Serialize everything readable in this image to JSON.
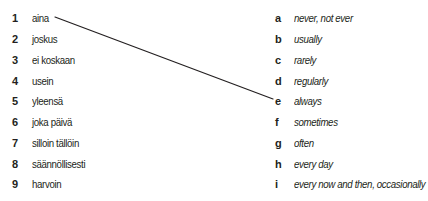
{
  "exercise": {
    "finnish_terms": [
      {
        "number": "1",
        "text": "aina"
      },
      {
        "number": "2",
        "text": "joskus"
      },
      {
        "number": "3",
        "text": "ei koskaan"
      },
      {
        "number": "4",
        "text": "usein"
      },
      {
        "number": "5",
        "text": "yleensä"
      },
      {
        "number": "6",
        "text": "joka päivä"
      },
      {
        "number": "7",
        "text": "silloin tällöin"
      },
      {
        "number": "8",
        "text": "säännöllisesti"
      },
      {
        "number": "9",
        "text": "harvoin"
      }
    ],
    "english_terms": [
      {
        "letter": "a",
        "text": "never, not ever"
      },
      {
        "letter": "b",
        "text": "usually"
      },
      {
        "letter": "c",
        "text": "rarely"
      },
      {
        "letter": "d",
        "text": "regularly"
      },
      {
        "letter": "e",
        "text": "always"
      },
      {
        "letter": "f",
        "text": "sometimes"
      },
      {
        "letter": "g",
        "text": "often"
      },
      {
        "letter": "h",
        "text": "every day"
      },
      {
        "letter": "i",
        "text": "every now and then, occasionally"
      }
    ],
    "example_match": {
      "from": "1",
      "to": "e",
      "line_color": "#231f20"
    }
  }
}
